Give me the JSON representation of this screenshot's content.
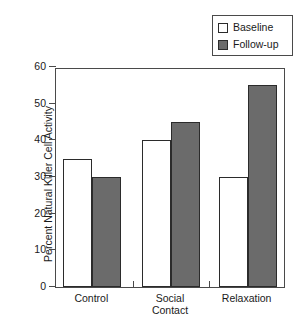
{
  "chart_data": {
    "type": "bar",
    "title": "",
    "xlabel": "",
    "ylabel": "Percent Natural Killer Cell Activity",
    "categories": [
      "Control",
      "Social Contact",
      "Relaxation"
    ],
    "category_lines": [
      [
        "Control"
      ],
      [
        "Social",
        "Contact"
      ],
      [
        "Relaxation"
      ]
    ],
    "series": [
      {
        "name": "Baseline",
        "values": [
          35,
          40,
          30
        ],
        "color": "#ffffff"
      },
      {
        "name": "Follow-up",
        "values": [
          30,
          45,
          55
        ],
        "color": "#6b6b6b"
      }
    ],
    "ylim": [
      0,
      60
    ],
    "yticks": [
      0,
      10,
      20,
      30,
      40,
      50,
      60
    ],
    "ytick_labels": [
      "0",
      "10",
      "20",
      "30",
      "40",
      "50",
      "60"
    ],
    "grid": false,
    "legend_position": "top-right",
    "legend_entries": [
      "Baseline",
      "Follow-up"
    ]
  },
  "legend": {
    "baseline_label": "Baseline",
    "followup_label": "Follow-up"
  },
  "axes": {
    "y_title": "Percent Natural Killer Cell Activity"
  }
}
